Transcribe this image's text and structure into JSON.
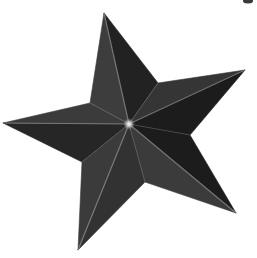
{
  "image": {
    "subject": "3D faceted five-pointed star",
    "background_color": "#ffffff",
    "center": [
      129,
      124
    ],
    "tips": {
      "top": [
        104,
        13
      ],
      "right": [
        245,
        70
      ],
      "bottom_right": [
        236,
        213
      ],
      "bottom_left": [
        78,
        250
      ],
      "left": [
        3,
        123
      ]
    },
    "notches": {
      "top_right": [
        158,
        83
      ],
      "right_bottom": [
        190,
        135
      ],
      "bottom": [
        145,
        182
      ],
      "bottom_left": [
        82,
        162
      ],
      "left_top": [
        90,
        103
      ]
    },
    "facet_colors": {
      "top_left": "#3d3d3d",
      "top_right": "#222222",
      "right_upper": "#363636",
      "right_lower": "#1c1c1c",
      "bottom_right_upper": "#1e1e1e",
      "bottom_right_lower": "#3a3a3a",
      "bottom_left_right": "#303030",
      "bottom_left_left": "#3a3a3a",
      "left_upper": "#3b3b3b",
      "left_lower": "#262626"
    },
    "ridge_color": "#8c8c8c",
    "center_highlight_color": "#f2f2f2",
    "corner_artifact_color": "#3a3a3a"
  }
}
